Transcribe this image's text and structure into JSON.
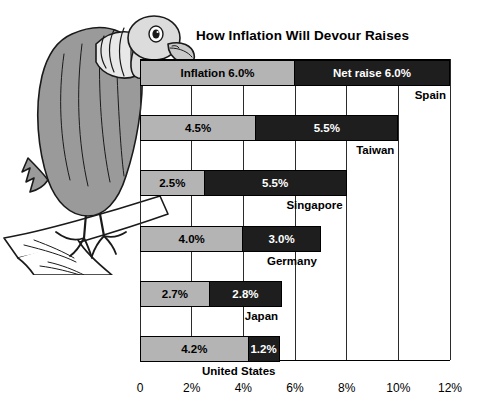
{
  "chart_data": {
    "type": "bar",
    "title": "How Inflation Will Devour Raises",
    "orientation": "horizontal",
    "stacked": true,
    "xlabel": "",
    "ylabel": "",
    "xlim": [
      0,
      12
    ],
    "xticks": [
      0,
      2,
      4,
      6,
      8,
      10,
      12
    ],
    "xticklabels": [
      "0",
      "2%",
      "4%",
      "6%",
      "8%",
      "10%",
      "12%"
    ],
    "grid": true,
    "legend_position": "in-first-bar",
    "categories": [
      "Spain",
      "Taiwan",
      "Singapore",
      "Germany",
      "Japan",
      "United States"
    ],
    "series": [
      {
        "name": "Inflation",
        "color": "#b4b4b4",
        "values": [
          6.0,
          4.5,
          2.5,
          4.0,
          2.7,
          4.2
        ]
      },
      {
        "name": "Net raise",
        "color": "#1e1e1e",
        "values": [
          6.0,
          5.5,
          5.5,
          3.0,
          2.8,
          1.2
        ]
      }
    ],
    "bars": [
      {
        "country": "Spain",
        "inflation": 6.0,
        "net_raise": 6.0,
        "inflation_label": "Inflation 6.0%",
        "net_label": "Net raise 6.0%",
        "total": 12.0
      },
      {
        "country": "Taiwan",
        "inflation": 4.5,
        "net_raise": 5.5,
        "inflation_label": "4.5%",
        "net_label": "5.5%",
        "total": 10.0
      },
      {
        "country": "Singapore",
        "inflation": 2.5,
        "net_raise": 5.5,
        "inflation_label": "2.5%",
        "net_label": "5.5%",
        "total": 8.0
      },
      {
        "country": "Germany",
        "inflation": 4.0,
        "net_raise": 3.0,
        "inflation_label": "4.0%",
        "net_label": "3.0%",
        "total": 7.0
      },
      {
        "country": "Japan",
        "inflation": 2.7,
        "net_raise": 2.8,
        "inflation_label": "2.7%",
        "net_label": "2.8%",
        "total": 5.5
      },
      {
        "country": "United States",
        "inflation": 4.2,
        "net_raise": 1.2,
        "inflation_label": "4.2%",
        "net_label": "1.2%",
        "total": 5.4
      }
    ]
  },
  "illustration": {
    "name": "vulture-perched-on-branch",
    "body_color": "#9a9a9a",
    "head_color": "#dcdcdc",
    "outline_color": "#1a1a1a"
  }
}
